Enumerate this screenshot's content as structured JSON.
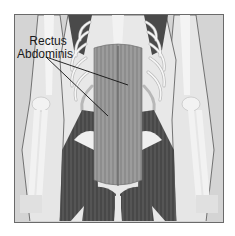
{
  "figure": {
    "label": {
      "line1": "Rectus",
      "line2": "Abdominis"
    },
    "pointers": [
      {
        "from": [
          46,
          57
        ],
        "to": [
          128,
          85
        ]
      },
      {
        "from": [
          46,
          57
        ],
        "to": [
          108,
          116
        ]
      }
    ],
    "colors": {
      "background": "#d4d4d4",
      "bone": "#efefef",
      "muscle_light": "#9a9a9a",
      "muscle_dark": "#4a4a4a",
      "frame_border": "#6a6a6a",
      "pointer": "#111111"
    }
  }
}
